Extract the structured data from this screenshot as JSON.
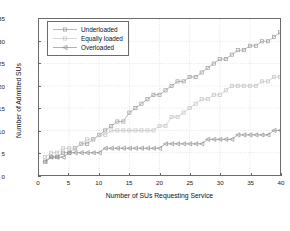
{
  "chart_data": {
    "type": "line",
    "title": "",
    "xlabel": "Number of SUs Requesting Service",
    "ylabel": "Number of Admitted SUs",
    "xlim": [
      0,
      40
    ],
    "ylim": [
      0,
      35
    ],
    "xticks": [
      0,
      5,
      10,
      15,
      20,
      25,
      30,
      35,
      40
    ],
    "yticks": [
      0,
      5,
      10,
      15,
      20,
      25,
      30,
      35
    ],
    "grid": true,
    "legend_position": "upper left",
    "x": [
      1,
      2,
      3,
      4,
      5,
      6,
      7,
      8,
      9,
      10,
      11,
      12,
      13,
      14,
      15,
      16,
      17,
      18,
      19,
      20,
      21,
      22,
      23,
      24,
      25,
      26,
      27,
      28,
      29,
      30,
      31,
      32,
      33,
      34,
      35,
      36,
      37,
      38,
      39,
      40
    ],
    "series": [
      {
        "name": "Underloaded",
        "marker": "square",
        "color": "#9a9a9a",
        "values": [
          3,
          4,
          4,
          5,
          5,
          6,
          7,
          7,
          8,
          9,
          10,
          11,
          12,
          12,
          14,
          15,
          16,
          17,
          18,
          18,
          19,
          20,
          21,
          21,
          22,
          22,
          23,
          24,
          25,
          26,
          26,
          27,
          28,
          28,
          29,
          29,
          30,
          30,
          31,
          32
        ]
      },
      {
        "name": "Equally loaded",
        "marker": "square",
        "color": "#c3c3c3",
        "values": [
          4,
          5,
          5,
          6,
          6,
          6,
          7,
          8,
          8,
          9,
          9,
          10,
          10,
          10,
          10,
          10,
          10,
          10,
          10,
          11,
          11,
          13,
          13,
          14,
          15,
          16,
          17,
          17,
          18,
          18,
          19,
          20,
          20,
          20,
          20,
          20,
          21,
          21,
          22,
          22
        ]
      },
      {
        "name": "Overloaded",
        "marker": "left-triangle",
        "color": "#8f8f8f",
        "values": [
          3,
          4,
          4,
          4,
          5,
          5,
          5,
          5,
          5,
          5,
          6,
          6,
          6,
          6,
          6,
          6,
          6,
          6,
          6,
          6,
          7,
          7,
          7,
          7,
          7,
          7,
          7,
          8,
          8,
          8,
          8,
          8,
          9,
          9,
          9,
          9,
          9,
          9,
          10,
          10
        ]
      }
    ]
  }
}
